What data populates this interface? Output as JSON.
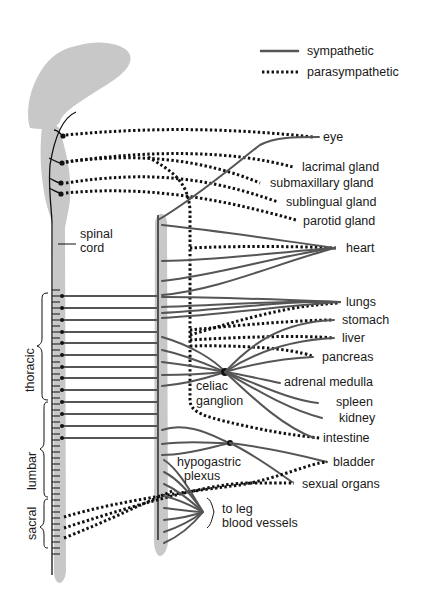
{
  "legend": {
    "sympathetic": "sympathetic",
    "parasympathetic": "parasympathetic"
  },
  "labels": {
    "spinal_cord_line1": "spinal",
    "spinal_cord_line2": "cord",
    "thoracic": "thoracic",
    "lumbar": "lumbar",
    "sacral": "sacral",
    "celiac_line1": "celiac",
    "celiac_line2": "ganglion",
    "hypogastric_line1": "hypogastric",
    "hypogastric_line2": "plexus",
    "leg_line1": "to leg",
    "leg_line2": "blood vessels"
  },
  "organs": [
    {
      "id": "eye",
      "label": "eye"
    },
    {
      "id": "lacrimal",
      "label": "lacrimal gland"
    },
    {
      "id": "submaxillary",
      "label": "submaxillary gland"
    },
    {
      "id": "sublingual",
      "label": "sublingual gland"
    },
    {
      "id": "parotid",
      "label": "parotid gland"
    },
    {
      "id": "heart",
      "label": "heart"
    },
    {
      "id": "lungs",
      "label": "lungs"
    },
    {
      "id": "stomach",
      "label": "stomach"
    },
    {
      "id": "liver",
      "label": "liver"
    },
    {
      "id": "pancreas",
      "label": "pancreas"
    },
    {
      "id": "adrenal",
      "label": "adrenal medulla"
    },
    {
      "id": "spleen",
      "label": "spleen"
    },
    {
      "id": "kidney",
      "label": "kidney"
    },
    {
      "id": "intestine",
      "label": "intestine"
    },
    {
      "id": "bladder",
      "label": "bladder"
    },
    {
      "id": "sexual",
      "label": "sexual organs"
    }
  ],
  "colors": {
    "tissue": "#c8c8c8",
    "sympathetic": "#555555",
    "parasympathetic": "#111111"
  }
}
